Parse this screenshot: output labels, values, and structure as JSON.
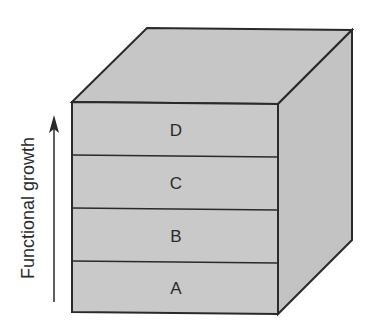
{
  "diagram": {
    "axis_label": "Functional growth",
    "layers": [
      {
        "label": "D"
      },
      {
        "label": "C"
      },
      {
        "label": "B"
      },
      {
        "label": "A"
      }
    ],
    "colors": {
      "face_fill": "#c9c9c9",
      "top_fill": "#c6c6c6",
      "side_fill": "#c3c3c3",
      "stroke": "#2a2a2a"
    }
  }
}
